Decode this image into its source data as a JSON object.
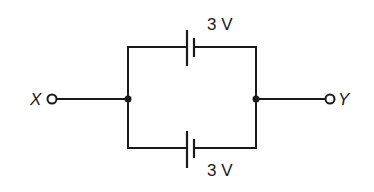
{
  "diagram": {
    "type": "circuit",
    "terminals": [
      {
        "id": "X",
        "label": "X"
      },
      {
        "id": "Y",
        "label": "Y"
      }
    ],
    "cells": [
      {
        "position": "top",
        "emf_label": "3 V"
      },
      {
        "position": "bottom",
        "emf_label": "3 V"
      }
    ],
    "junctions": 2,
    "colors": {
      "line": "#1a1a1a",
      "background": "#ffffff"
    }
  }
}
